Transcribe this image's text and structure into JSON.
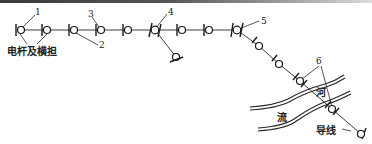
{
  "diagram": {
    "type": "overhead power line route plan",
    "labels": {
      "pole_and_crossarm": "电杆及横担",
      "river_char_1": "河",
      "river_char_2": "流",
      "conductor": "导线"
    },
    "callouts": [
      {
        "id": "1",
        "text": "1"
      },
      {
        "id": "2",
        "text": "2"
      },
      {
        "id": "3",
        "text": "3"
      },
      {
        "id": "4",
        "text": "4"
      },
      {
        "id": "5",
        "text": "5"
      },
      {
        "id": "6",
        "text": "6"
      }
    ],
    "poles": [
      {
        "x": 21,
        "y": 30,
        "kind": "straight"
      },
      {
        "x": 47,
        "y": 30,
        "kind": "straight"
      },
      {
        "x": 74,
        "y": 30,
        "kind": "straight"
      },
      {
        "x": 101,
        "y": 30,
        "kind": "straight"
      },
      {
        "x": 128,
        "y": 30,
        "kind": "straight"
      },
      {
        "x": 155,
        "y": 30,
        "kind": "branch-crossed"
      },
      {
        "x": 182,
        "y": 30,
        "kind": "straight"
      },
      {
        "x": 209,
        "y": 30,
        "kind": "straight"
      },
      {
        "x": 237,
        "y": 30,
        "kind": "angle-crossed"
      },
      {
        "x": 259,
        "y": 46,
        "kind": "diagonal"
      },
      {
        "x": 279,
        "y": 64,
        "kind": "diagonal"
      },
      {
        "x": 300,
        "y": 81,
        "kind": "crossing-span"
      },
      {
        "x": 332,
        "y": 109,
        "kind": "crossing-span"
      },
      {
        "x": 361,
        "y": 134,
        "kind": "diagonal"
      },
      {
        "x": 176,
        "y": 57,
        "kind": "branch-end"
      }
    ],
    "colors": {
      "line": "#2a2a2a",
      "background": "#ffffff"
    }
  }
}
